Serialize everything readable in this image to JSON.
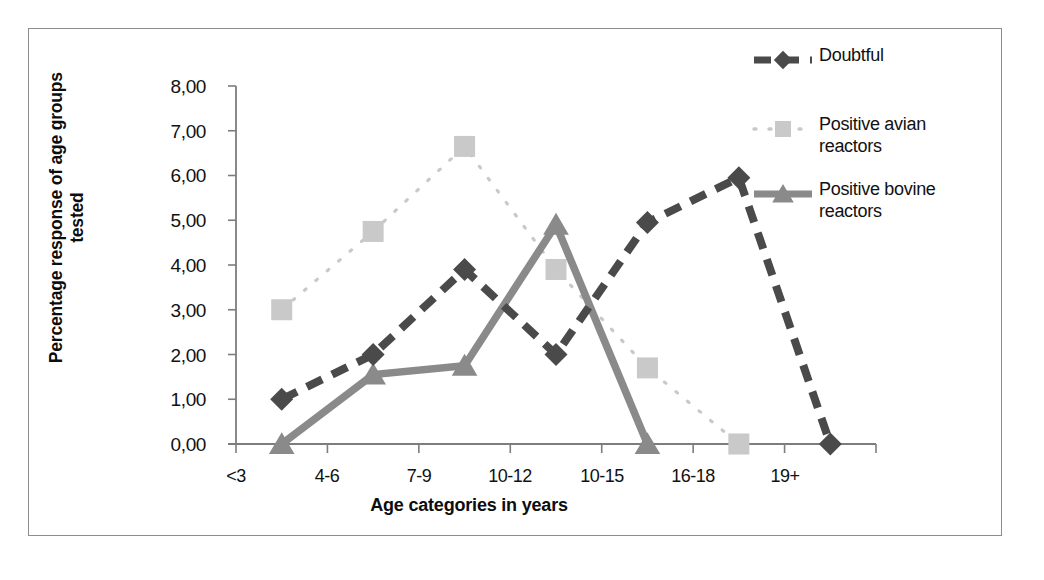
{
  "chart_data": {
    "type": "line",
    "title": "",
    "xlabel": "Age categories in years",
    "ylabel": "Percentage response of age groups tested",
    "categories": [
      "<3",
      "4-6",
      "7-9",
      "10-12",
      "10-15",
      "16-18",
      "19+"
    ],
    "yticks": [
      "0,00",
      "1,00",
      "2,00",
      "3,00",
      "4,00",
      "5,00",
      "6,00",
      "7,00",
      "8,00"
    ],
    "ylim": [
      0,
      8
    ],
    "grid": false,
    "legend_position": "right",
    "decimal_separator": ",",
    "series": [
      {
        "name": "Doubtful",
        "values": [
          1.0,
          2.0,
          3.9,
          2.0,
          4.95,
          5.95,
          0.0
        ],
        "color": "#4a4a4a",
        "marker": "diamond",
        "linestyle": "dashed"
      },
      {
        "name": "Positive avian reactors",
        "values": [
          3.0,
          4.75,
          6.65,
          3.9,
          1.7,
          0.0,
          null
        ],
        "color": "#c9c9c9",
        "marker": "square",
        "linestyle": "dotted"
      },
      {
        "name": "Positive bovine reactors",
        "values": [
          0.0,
          1.55,
          1.75,
          4.9,
          0.0,
          null,
          null
        ],
        "color": "#8a8a8a",
        "marker": "triangle",
        "linestyle": "solid"
      }
    ]
  },
  "axis": {
    "y_title": "Percentage response of age groups tested",
    "x_title": "Age categories in years",
    "y_ticks": [
      "8,00",
      "7,00",
      "6,00",
      "5,00",
      "4,00",
      "3,00",
      "2,00",
      "1,00",
      "0,00"
    ],
    "x_ticks": [
      "<3",
      "4-6",
      "7-9",
      "10-12",
      "10-15",
      "16-18",
      "19+"
    ]
  },
  "legend": {
    "items": [
      {
        "label": "Doubtful",
        "label_line1": "Doubtful",
        "label_line2": ""
      },
      {
        "label": "Positive avian reactors",
        "label_line1": "Positive avian",
        "label_line2": "reactors"
      },
      {
        "label": "Positive bovine reactors",
        "label_line1": "Positive bovine",
        "label_line2": "reactors"
      }
    ]
  },
  "colors": {
    "doubtful": "#4a4a4a",
    "avian": "#c9c9c9",
    "bovine": "#8a8a8a",
    "axis": "#7d7d7d",
    "frame": "#8d8d8d",
    "text": "#111111"
  }
}
